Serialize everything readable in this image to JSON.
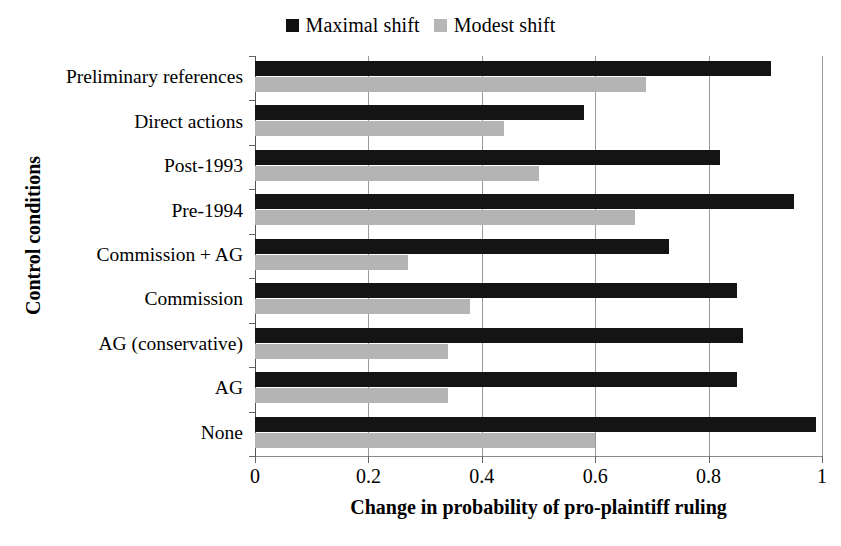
{
  "chart_data": {
    "type": "bar",
    "orientation": "horizontal",
    "title": "",
    "xlabel": "Change in probability of pro-plaintiff ruling",
    "ylabel": "Control conditions",
    "xlim": [
      0,
      1
    ],
    "xticks": [
      "0",
      "0.2",
      "0.4",
      "0.6",
      "0.8",
      "1"
    ],
    "xtick_values": [
      0,
      0.2,
      0.4,
      0.6,
      0.8,
      1
    ],
    "grid": true,
    "grid_axis": "x",
    "legend_position": "top-center",
    "categories": [
      "Preliminary references",
      "Direct actions",
      "Post-1993",
      "Pre-1994",
      "Commission + AG",
      "Commission",
      "AG (conservative)",
      "AG",
      "None"
    ],
    "series": [
      {
        "name": "Maximal shift",
        "color": "#141414",
        "values": [
          0.91,
          0.58,
          0.82,
          0.95,
          0.73,
          0.85,
          0.86,
          0.85,
          0.99
        ]
      },
      {
        "name": "Modest shift",
        "color": "#b4b4b4",
        "values": [
          0.69,
          0.44,
          0.5,
          0.67,
          0.27,
          0.38,
          0.34,
          0.34,
          0.6
        ]
      }
    ]
  },
  "legend": {
    "entries": [
      {
        "label": "Maximal shift",
        "swatch": "maximal"
      },
      {
        "label": "Modest shift",
        "swatch": "modest"
      }
    ]
  }
}
